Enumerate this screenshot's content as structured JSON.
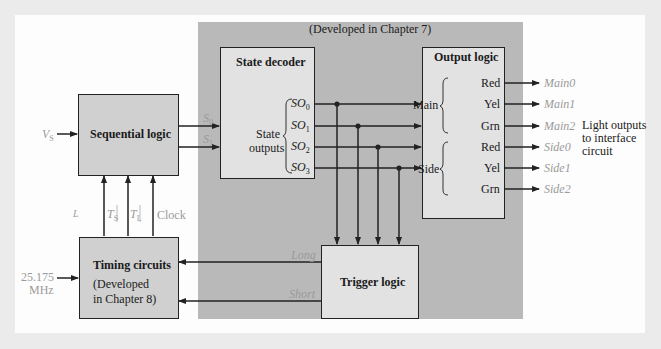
{
  "header": {
    "developed_ch7": "(Developed in Chapter 7)"
  },
  "blocks": {
    "sequential_logic": {
      "title": "Sequential logic"
    },
    "state_decoder": {
      "title": "State decoder",
      "group_label_1": "State",
      "group_label_2": "outputs",
      "outputs": [
        "SO0",
        "SO1",
        "SO2",
        "SO3"
      ]
    },
    "output_logic": {
      "title": "Output logic",
      "main_label": "Main",
      "side_label": "Side",
      "main_ports": [
        "Red",
        "Yel",
        "Grn"
      ],
      "side_ports": [
        "Red",
        "Yel",
        "Grn"
      ]
    },
    "timing_circuits": {
      "title": "Timing circuits",
      "note_1": "(Developed",
      "note_2": "in Chapter 8)"
    },
    "trigger_logic": {
      "title": "Trigger logic"
    }
  },
  "signals": {
    "vs": "V",
    "vs_sub": "S",
    "s0": "S",
    "s0_sub": "0",
    "s1": "S",
    "s1_sub": "1",
    "ts": "T",
    "ts_sub": "S",
    "tl": "T",
    "tl_sub": "L",
    "clock": "Clock",
    "l": "L",
    "clock_in_1": "25.175",
    "clock_in_2": "MHz",
    "long": "Long",
    "short": "Short",
    "so_base": "SO",
    "so_subs": [
      "0",
      "1",
      "2",
      "3"
    ]
  },
  "outputs": {
    "main": [
      "Main0",
      "Main1",
      "Main2"
    ],
    "side": [
      "Side0",
      "Side1",
      "Side2"
    ],
    "caption_1": "Light outputs",
    "caption_2": "to interface",
    "caption_3": "circuit"
  },
  "colors": {
    "background": "#ebebeb",
    "frame": "#fdfdfd",
    "gray_region": "#b9b9b9",
    "box_fill": "#e2e2e2",
    "line": "#222222",
    "signal_label": "#9a9a9a"
  }
}
